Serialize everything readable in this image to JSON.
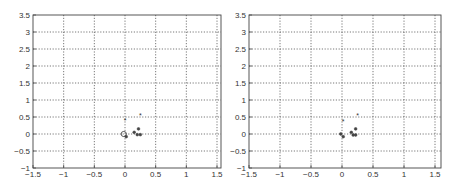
{
  "chart_data": [
    {
      "type": "scatter",
      "title": "",
      "xlabel": "",
      "ylabel": "",
      "xlim": [
        -1.5,
        1.6
      ],
      "ylim": [
        -1,
        3.5
      ],
      "grid": true,
      "x_ticks": [
        "-1.5",
        "-1",
        "-0.5",
        "0",
        "0.5",
        "1",
        "1.5"
      ],
      "y_ticks": [
        "-1",
        "-0.5",
        "0",
        "0.5",
        "1",
        "1.5",
        "2",
        "2.5",
        "3",
        "3.5"
      ],
      "series": [
        {
          "name": "points",
          "marker": "mixed",
          "x": [
            0.0,
            0.25,
            -0.02,
            0.02,
            0.15,
            0.2,
            0.22,
            0.25
          ],
          "y": [
            0.4,
            0.55,
            0.0,
            -0.08,
            0.05,
            -0.02,
            0.15,
            -0.02
          ]
        }
      ]
    },
    {
      "type": "scatter",
      "title": "",
      "xlabel": "",
      "ylabel": "",
      "xlim": [
        -1.5,
        1.6
      ],
      "ylim": [
        -1,
        3.5
      ],
      "grid": true,
      "x_ticks": [
        "-1.5",
        "-1",
        "-0.5",
        "0",
        "0.5",
        "1",
        "1.5"
      ],
      "y_ticks": [
        "-1",
        "-0.5",
        "0",
        "0.5",
        "1",
        "1.5",
        "2",
        "2.5",
        "3",
        "3.5"
      ],
      "series": [
        {
          "name": "points",
          "marker": "mixed",
          "x": [
            0.02,
            0.25,
            -0.02,
            0.02,
            0.15,
            0.18,
            0.22,
            0.22
          ],
          "y": [
            0.38,
            0.55,
            0.0,
            -0.08,
            0.05,
            -0.03,
            0.15,
            -0.03
          ]
        }
      ]
    }
  ]
}
